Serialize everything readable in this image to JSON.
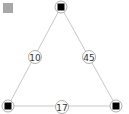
{
  "corner_swatch": {
    "color": "#a8a8a8"
  },
  "graph": {
    "nodes": [
      {
        "id": "top",
        "x": 61,
        "y": 7
      },
      {
        "id": "bottom-left",
        "x": 8,
        "y": 106
      },
      {
        "id": "bottom-right",
        "x": 116,
        "y": 106
      }
    ],
    "edges": [
      {
        "from": "top",
        "to": "bottom-left",
        "label": "10",
        "lx": 35,
        "ly": 57
      },
      {
        "from": "top",
        "to": "bottom-right",
        "label": "45",
        "lx": 89,
        "ly": 57
      },
      {
        "from": "bottom-left",
        "to": "bottom-right",
        "label": "17",
        "lx": 62,
        "ly": 107
      }
    ],
    "colors": {
      "edge": "#c8c8c8",
      "node_fill": "#000000",
      "circle_stroke": "#999999"
    }
  }
}
